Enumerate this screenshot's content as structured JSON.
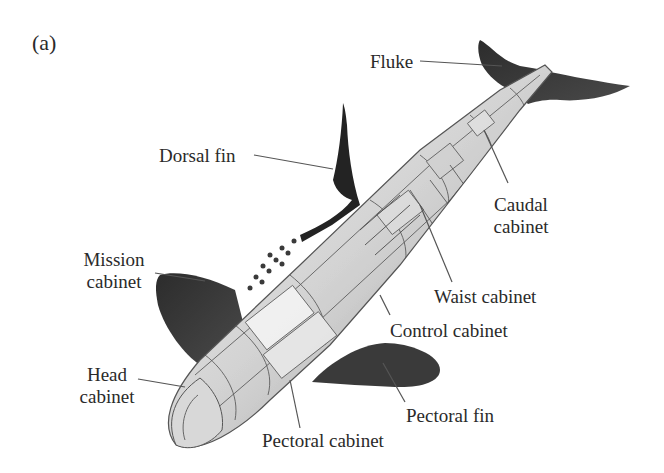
{
  "figure": {
    "panel_label": "(a)",
    "colors": {
      "fin": "#3a3a3a",
      "body_light": "#e4e4e4",
      "body_mid": "#b9b9b9",
      "line": "#555555",
      "text": "#2a2a2a"
    }
  },
  "labels": {
    "fluke": "Fluke",
    "dorsal_fin": "Dorsal fin",
    "caudal_cabinet_1": "Caudal",
    "caudal_cabinet_2": "cabinet",
    "mission_cabinet_1": "Mission",
    "mission_cabinet_2": "cabinet",
    "waist_cabinet": "Waist cabinet",
    "control_cabinet": "Control cabinet",
    "head_cabinet_1": "Head",
    "head_cabinet_2": "cabinet",
    "pectoral_fin": "Pectoral fin",
    "pectoral_cabinet": "Pectoral cabinet"
  }
}
